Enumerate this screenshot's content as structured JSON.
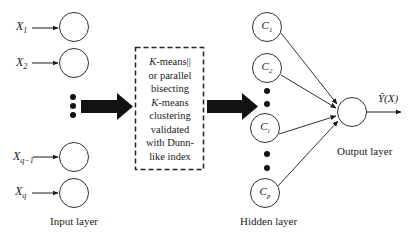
{
  "diagram": {
    "type": "rbf-network-flow",
    "input_layer": {
      "label": "Input layer",
      "inputs": [
        {
          "var": "X",
          "sub": "1"
        },
        {
          "var": "X",
          "sub": "2"
        },
        {
          "var": "X",
          "sub": "q−1"
        },
        {
          "var": "X",
          "sub": "q"
        }
      ]
    },
    "clustering_box": {
      "lines": [
        {
          "italic": "K",
          "text": "-means||"
        },
        {
          "italic": "",
          "text": "or parallel"
        },
        {
          "italic": "",
          "text": "bisecting"
        },
        {
          "italic": "K",
          "text": "-means"
        },
        {
          "italic": "",
          "text": "clustering"
        },
        {
          "italic": "",
          "text": "validated"
        },
        {
          "italic": "",
          "text": "with Dunn-"
        },
        {
          "italic": "",
          "text": "like index"
        }
      ]
    },
    "hidden_layer": {
      "label": "Hidden layer",
      "nodes": [
        {
          "var": "C",
          "sub": "1"
        },
        {
          "var": "C",
          "sub": "2"
        },
        {
          "var": "C",
          "sub": "i"
        },
        {
          "var": "C",
          "sub": "p"
        }
      ]
    },
    "output_layer": {
      "label": "Output layer",
      "output": "Ŷ(X)"
    },
    "colors": {
      "stroke": "#1a1a1a",
      "fill": "#ffffff"
    }
  }
}
